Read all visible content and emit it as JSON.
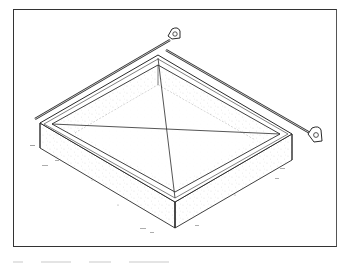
{
  "figure": {
    "elements": {
      "form": "rectangular foundation form (isometric view)",
      "diagonals": [
        "diagonal line corner-to-corner A",
        "diagonal line corner-to-corner B"
      ],
      "tape_measures": [
        "tape measure along back-left edge",
        "tape measure along back-right edge"
      ],
      "ground": "stippled soil/concrete texture"
    },
    "caption": ""
  },
  "colors": {
    "line": "#2a2a2a",
    "stipple": "#9a9a9a",
    "background": "#ffffff",
    "frame": "#333333"
  }
}
